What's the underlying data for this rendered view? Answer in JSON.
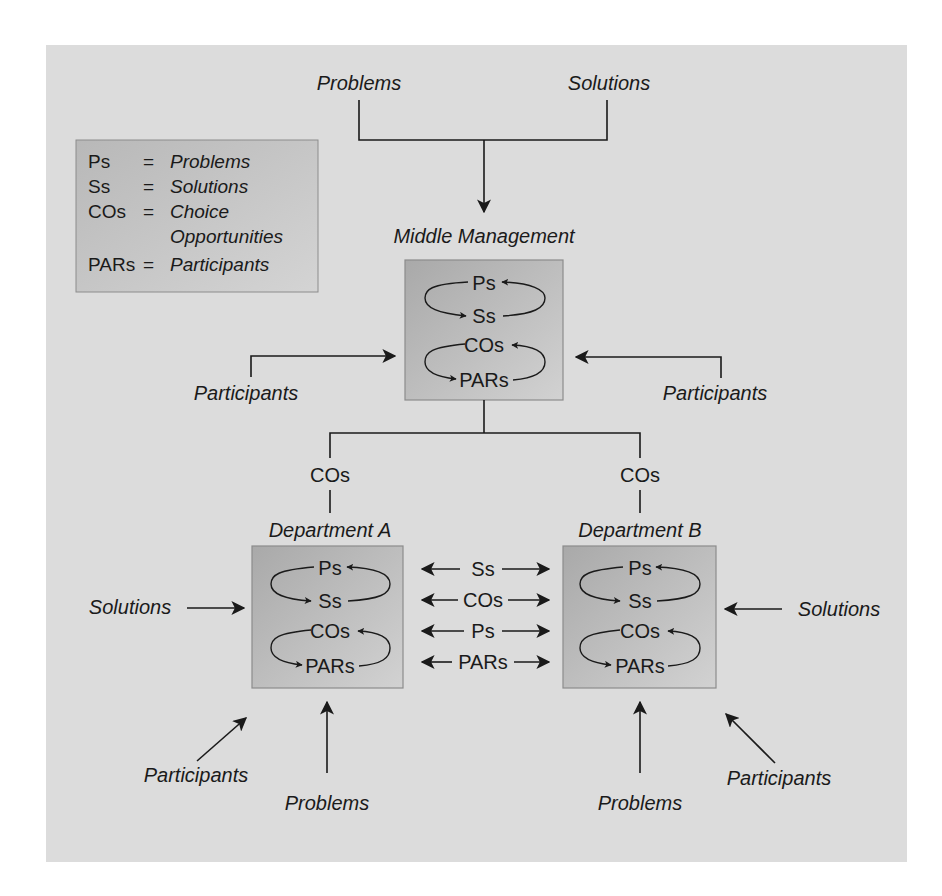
{
  "diagram": {
    "type": "garbage-can-model-flow",
    "colors": {
      "panel_background": "#dcdcdc",
      "page_background": "#ffffff",
      "box_gradient_dark": "#a9a9a9",
      "box_gradient_light": "#d2d2d2",
      "box_border": "#8c8c8c",
      "line": "#1a1a1a"
    },
    "legend": {
      "items": [
        {
          "abbr": "Ps",
          "eq": "=",
          "def": "Problems"
        },
        {
          "abbr": "Ss",
          "eq": "=",
          "def": "Solutions"
        },
        {
          "abbr": "COs",
          "eq": "=",
          "def": "Choice",
          "def2": "Opportunities"
        },
        {
          "abbr": "PARs",
          "eq": "=",
          "def": "Participants"
        }
      ]
    },
    "top_inputs": {
      "left": "Problems",
      "right": "Solutions"
    },
    "middle_management": {
      "title": "Middle Management",
      "cycle_top": {
        "a": "Ps",
        "b": "Ss"
      },
      "cycle_bottom": {
        "a": "COs",
        "b": "PARs"
      },
      "left_input": "Participants",
      "right_input": "Participants"
    },
    "branches": {
      "left_label": "COs",
      "right_label": "COs"
    },
    "department_a": {
      "title": "Department A",
      "cycle_top": {
        "a": "Ps",
        "b": "Ss"
      },
      "cycle_bottom": {
        "a": "COs",
        "b": "PARs"
      },
      "side_input": "Solutions",
      "diagonal_input": "Participants",
      "bottom_input": "Problems"
    },
    "department_b": {
      "title": "Department B",
      "cycle_top": {
        "a": "Ps",
        "b": "Ss"
      },
      "cycle_bottom": {
        "a": "COs",
        "b": "PARs"
      },
      "side_input": "Solutions",
      "diagonal_input": "Participants",
      "bottom_input": "Problems"
    },
    "exchanges": [
      {
        "label": "Ss",
        "direction": "both"
      },
      {
        "label": "COs",
        "direction": "both"
      },
      {
        "label": "Ps",
        "direction": "both"
      },
      {
        "label": "PARs",
        "direction": "both"
      }
    ]
  }
}
